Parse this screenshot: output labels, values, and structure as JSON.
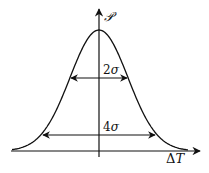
{
  "diagram": {
    "type": "gaussian-width-illustration",
    "y_axis_label": "𝒫",
    "x_axis_label_delta": "Δ",
    "x_axis_label_var": "T",
    "annotations": [
      {
        "id": "inner",
        "coef": "2",
        "sym": "σ",
        "meaning": "width at 1σ height"
      },
      {
        "id": "outer",
        "coef": "4",
        "sym": "σ",
        "meaning": "width at 2σ height"
      }
    ],
    "geometry": {
      "center_x": 99,
      "baseline_y": 151,
      "peak_y": 30,
      "sigma_px": 29
    },
    "colors": {
      "stroke": "#111111",
      "background": "#ffffff"
    }
  }
}
